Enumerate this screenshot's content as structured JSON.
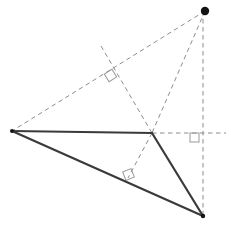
{
  "figure": {
    "width": 231,
    "height": 236,
    "background_color": "#ffffff",
    "solid_color": "#3a3a3a",
    "dashed_color": "#8d8d8d",
    "marker_color": "#9a9a9a",
    "vertex_dot_color": "#141414",
    "solid_width": 2.2,
    "dashed_width": 1.0,
    "dash_pattern": "4.5,3.5"
  },
  "points": {
    "A": {
      "name": "left-vertex",
      "x": 12,
      "y": 131,
      "label": ""
    },
    "B": {
      "name": "middle-vertex",
      "x": 152,
      "y": 133,
      "label": ""
    },
    "C": {
      "name": "bottom-right-vertex",
      "x": 203,
      "y": 216,
      "label": ""
    },
    "H": {
      "name": "orthocenter-point",
      "x": 205,
      "y": 11,
      "label": ""
    },
    "F1": {
      "name": "foot-on-line-AB-extended",
      "x": 110,
      "y": 76,
      "label": ""
    },
    "F2": {
      "name": "foot-on-side-AC",
      "x": 128,
      "y": 178,
      "label": ""
    },
    "F3": {
      "name": "foot-on-line-BC-extended",
      "x": 203,
      "y": 133,
      "label": ""
    }
  },
  "solid_edges": [
    {
      "name": "edge-A-B",
      "from": "A",
      "to": "B"
    },
    {
      "name": "edge-B-C",
      "from": "B",
      "to": "C"
    },
    {
      "name": "edge-A-C",
      "from": "A",
      "to": "C"
    }
  ],
  "dashed_edges": [
    {
      "name": "altitude-H-to-A",
      "x1": 205,
      "y1": 11,
      "x2": 12,
      "y2": 131
    },
    {
      "name": "altitude-H-to-B",
      "x1": 205,
      "y1": 11,
      "x2": 152,
      "y2": 133
    },
    {
      "name": "altitude-H-vertical-to-C",
      "x1": 203,
      "y1": 11,
      "x2": 203,
      "y2": 216
    },
    {
      "name": "altitude-B-to-side-AC",
      "x1": 152,
      "y1": 133,
      "x2": 128,
      "y2": 178
    },
    {
      "name": "altitude-extension-through-foot-F1",
      "x1": 101,
      "y1": 46,
      "x2": 152,
      "y2": 133
    },
    {
      "name": "horizontal-extension-from-B",
      "x1": 152,
      "y1": 133,
      "x2": 226,
      "y2": 133
    }
  ],
  "right_angle_markers": [
    {
      "name": "right-angle-marker-upper",
      "x": 106,
      "y": 71,
      "size": 9,
      "rotation": -32
    },
    {
      "name": "right-angle-marker-lower",
      "x": 124,
      "y": 170,
      "size": 9,
      "rotation": -22
    },
    {
      "name": "right-angle-marker-right",
      "x": 190,
      "y": 133,
      "size": 9,
      "rotation": 0
    }
  ],
  "vertex_dots": [
    {
      "name": "vertex-dot-orthocenter",
      "x": 205,
      "y": 11,
      "r": 4.2
    },
    {
      "name": "vertex-dot-bottom-right",
      "x": 203,
      "y": 216,
      "r": 2.2
    },
    {
      "name": "vertex-dot-left",
      "x": 12,
      "y": 131,
      "r": 2.0
    }
  ]
}
